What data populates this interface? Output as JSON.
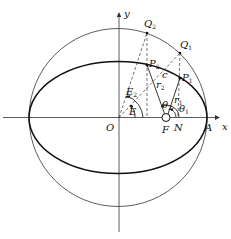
{
  "figure": {
    "type": "kepler-eccentric-anomaly-construction"
  },
  "labels": {
    "y_axis": "y",
    "x_axis": "x",
    "origin": "O",
    "focus": "F",
    "foot": "N",
    "vertex": "A",
    "Q1": {
      "base": "Q",
      "sub": "1"
    },
    "Q2": {
      "base": "Q",
      "sub": "2"
    },
    "P1": {
      "base": "P",
      "sub": "1"
    },
    "P2": {
      "base": "P",
      "sub": "2"
    },
    "c": "c",
    "r1": {
      "base": "r",
      "sub": "1"
    },
    "r2": {
      "base": "r",
      "sub": "2"
    },
    "theta1": {
      "base": "θ",
      "sub": "1"
    },
    "theta2": {
      "base": "θ",
      "sub": "2"
    },
    "E1": {
      "base": "E",
      "sub": ""
    },
    "E2": {
      "base": "E",
      "sub": "2"
    }
  },
  "colors": {
    "stroke": "#111111",
    "background": "#ffffff"
  }
}
